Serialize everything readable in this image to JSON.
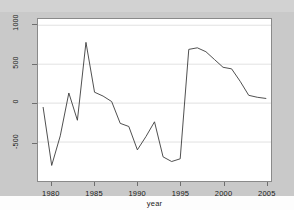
{
  "figure": {
    "background_color": "#c9c9c9",
    "plot_background_color": "#ffffff",
    "frame_color": "#8a8a8a",
    "grid_color": "#d9d9d9",
    "line_color": "#3a3a3a"
  },
  "chart_data": {
    "type": "line",
    "title": "",
    "subtitle": "",
    "xlabel": "year",
    "ylabel": "",
    "xlim": [
      1978.4,
      2005.6
    ],
    "ylim": [
      -1000,
      1080
    ],
    "xticks": [
      1980,
      1985,
      1990,
      1995,
      2000,
      2005
    ],
    "xticklabels": [
      "1980",
      "1985",
      "1990",
      "1995",
      "2000",
      "2005"
    ],
    "yticks": [
      -500,
      0,
      500,
      1000
    ],
    "yticklabels": [
      "-500",
      "0",
      "500",
      "1000"
    ],
    "grid": "horizontal",
    "legend": null,
    "legend_position": "none",
    "x": [
      1979,
      1980,
      1981,
      1982,
      1983,
      1984,
      1985,
      1986,
      1987,
      1988,
      1989,
      1990,
      1991,
      1992,
      1993,
      1994,
      1995,
      1996,
      1997,
      1998,
      1999,
      2000,
      2001,
      2002,
      2003,
      2004,
      2005
    ],
    "series": [
      {
        "name": "value",
        "values": [
          -55,
          -800,
          -420,
          130,
          -220,
          780,
          140,
          90,
          20,
          -260,
          -300,
          -600,
          -430,
          -240,
          -690,
          -750,
          -715,
          690,
          710,
          660,
          560,
          460,
          440,
          280,
          100,
          75,
          60
        ]
      }
    ]
  }
}
